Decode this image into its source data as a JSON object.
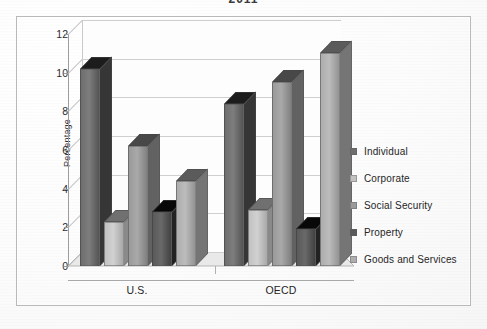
{
  "title": "2011",
  "frame": {
    "border_color": "#b9b9b9"
  },
  "chart_data": {
    "type": "bar",
    "title": "2011",
    "xlabel": "",
    "ylabel": "Percentage",
    "ylim": [
      0,
      12
    ],
    "yticks": [
      0,
      2,
      4,
      6,
      8,
      10,
      12
    ],
    "grid": true,
    "legend_position": "right",
    "three_d": true,
    "categories": [
      "U.S.",
      "OECD"
    ],
    "series": [
      {
        "name": "Individual",
        "values": [
          10.2,
          8.4
        ],
        "color": "#6e6e6e"
      },
      {
        "name": "Corporate",
        "values": [
          2.3,
          2.9
        ],
        "color": "#c2c2c2"
      },
      {
        "name": "Social Security",
        "values": [
          6.2,
          9.5
        ],
        "color": "#9a9a9a"
      },
      {
        "name": "Property",
        "values": [
          2.8,
          1.9
        ],
        "color": "#5a5a5a"
      },
      {
        "name": "Goods and Services",
        "values": [
          4.4,
          11.0
        ],
        "color": "#adadad"
      }
    ]
  }
}
